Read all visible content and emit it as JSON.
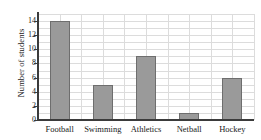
{
  "chart_data": {
    "type": "bar",
    "title": "",
    "xlabel": "",
    "ylabel": "Number of students",
    "categories": [
      "Football",
      "Swimming",
      "Athletics",
      "Netball",
      "Hockey"
    ],
    "values": [
      14,
      5,
      9,
      1,
      6
    ],
    "ylim": [
      0,
      15
    ],
    "yticks": [
      0,
      2,
      4,
      6,
      8,
      10,
      12,
      14
    ],
    "ytick_labels": [
      "0",
      "2",
      "4",
      "6",
      "8",
      "10",
      "12",
      "14"
    ],
    "grid": true,
    "legend": false,
    "colors": {
      "bar_fill": "#9a9a9a",
      "bar_edge": "#6e6e6e",
      "gridline": "#dcdcdc",
      "axis": "#3b3b3b",
      "background": "#ffffff",
      "text": "#1a1a1a"
    }
  }
}
